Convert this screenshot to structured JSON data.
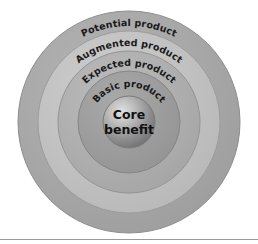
{
  "diagram": {
    "type": "concentric-circles",
    "background_color": "#ffffff",
    "label_text_color": "#1a1a1a",
    "levels": [
      {
        "id": "potential-product",
        "label": "Potential product",
        "order": 1,
        "position": "outermost-ring",
        "fill_color": "#a8a8a8",
        "stroke_color": "#8d8d8d",
        "outer_radius": 111,
        "inner_radius": 91,
        "label_arc_radius": 101
      },
      {
        "id": "augmented-product",
        "label": "Augmented product",
        "order": 2,
        "position": "second-ring",
        "fill_color": "#c2c2c2",
        "stroke_color": "#9c9c9c",
        "outer_radius": 91,
        "inner_radius": 71,
        "label_arc_radius": 81
      },
      {
        "id": "expected-product",
        "label": "Expected product",
        "order": 3,
        "position": "third-ring",
        "fill_color": "#b0b0b0",
        "stroke_color": "#949494",
        "outer_radius": 71,
        "inner_radius": 51,
        "label_arc_radius": 61
      },
      {
        "id": "basic-product",
        "label": "Basic product",
        "order": 4,
        "position": "fourth-ring",
        "fill_color": "#9d9d9d",
        "stroke_color": "#868686",
        "outer_radius": 51,
        "inner_radius": 26,
        "label_arc_radius": 40
      }
    ],
    "core": {
      "id": "core-benefit",
      "label_line_1": "Core",
      "label_line_2": "benefit",
      "order": 5,
      "position": "center",
      "radius": 26,
      "fill_color": "#9a9a9a",
      "highlight_color": "#d6d6d6",
      "shadow_color": "#6f6f6f",
      "stroke_color": "#7b7b7b"
    },
    "center": {
      "cx": 129,
      "cy": 122
    },
    "footer_rule": {
      "color": "#9a9a9a",
      "y": 239
    }
  }
}
